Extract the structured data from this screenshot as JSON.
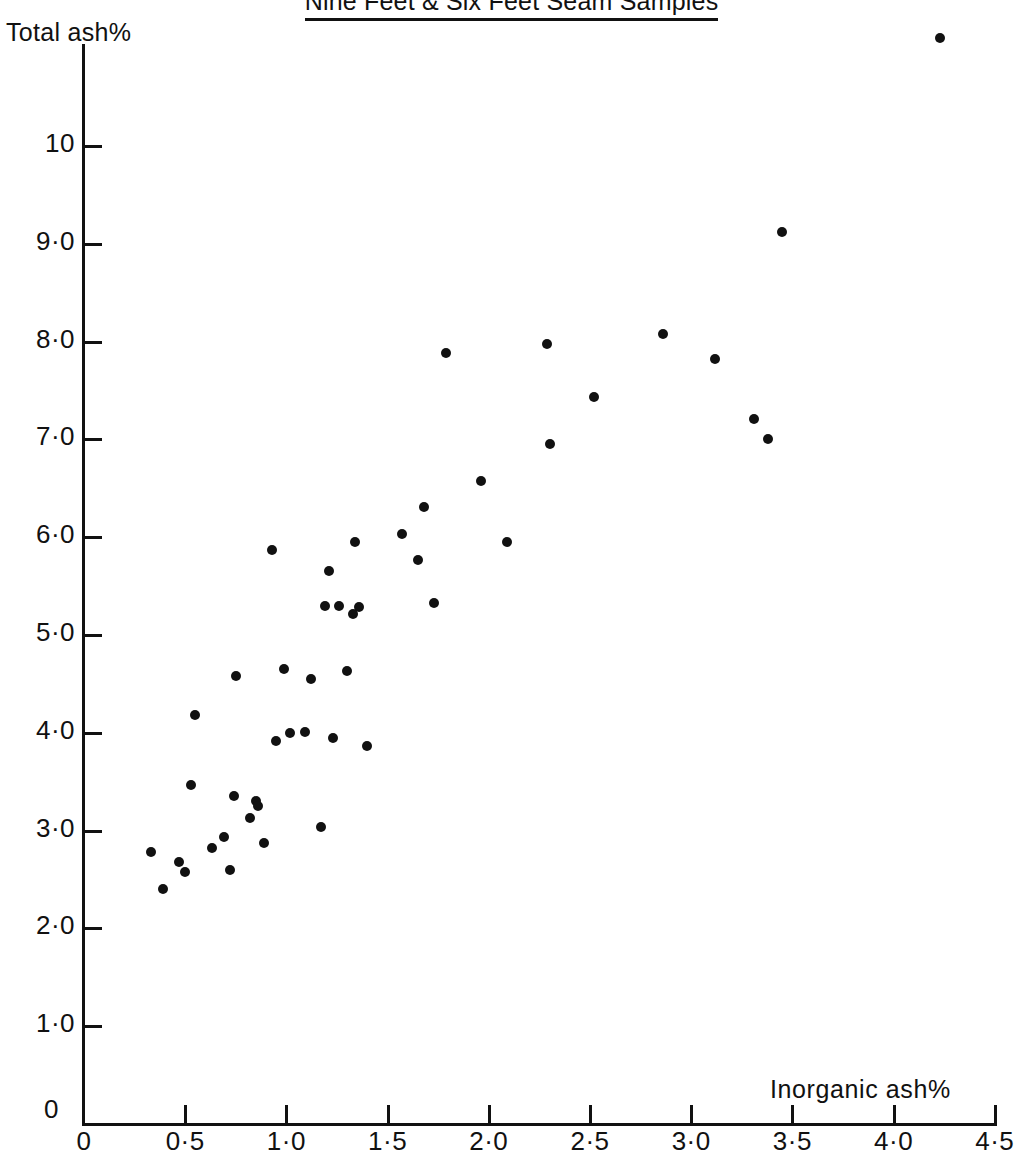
{
  "chart_data": {
    "type": "scatter",
    "title": "Nine Feet & Six Feet Seam Samples",
    "xlabel": "Inorganic ash%",
    "ylabel": "Total ash%",
    "xlim": [
      0,
      4.5
    ],
    "ylim": [
      0,
      11.2
    ],
    "grid": false,
    "legend": null,
    "x_ticks": [
      {
        "value": 0,
        "label": "0"
      },
      {
        "value": 0.5,
        "label": "0·5"
      },
      {
        "value": 1.0,
        "label": "1·0"
      },
      {
        "value": 1.5,
        "label": "1·5"
      },
      {
        "value": 2.0,
        "label": "2·0"
      },
      {
        "value": 2.5,
        "label": "2·5"
      },
      {
        "value": 3.0,
        "label": "3·0"
      },
      {
        "value": 3.5,
        "label": "3·5"
      },
      {
        "value": 4.0,
        "label": "4·0"
      },
      {
        "value": 4.5,
        "label": "4·5"
      }
    ],
    "y_ticks": [
      {
        "value": 1.0,
        "label": "1·0"
      },
      {
        "value": 2.0,
        "label": "2·0"
      },
      {
        "value": 3.0,
        "label": "3·0"
      },
      {
        "value": 4.0,
        "label": "4·0"
      },
      {
        "value": 5.0,
        "label": "5·0"
      },
      {
        "value": 6.0,
        "label": "6·0"
      },
      {
        "value": 7.0,
        "label": "7·0"
      },
      {
        "value": 8.0,
        "label": "8·0"
      },
      {
        "value": 9.0,
        "label": "9·0"
      },
      {
        "value": 10.0,
        "label": "10"
      }
    ],
    "origin_label": "0",
    "marker": {
      "shape": "circle",
      "color": "#111111",
      "size_px": 10
    },
    "points": [
      {
        "x": 0.33,
        "y": 2.78
      },
      {
        "x": 0.39,
        "y": 2.4
      },
      {
        "x": 0.47,
        "y": 2.68
      },
      {
        "x": 0.5,
        "y": 2.58
      },
      {
        "x": 0.53,
        "y": 3.47
      },
      {
        "x": 0.55,
        "y": 4.18
      },
      {
        "x": 0.63,
        "y": 2.82
      },
      {
        "x": 0.69,
        "y": 2.93
      },
      {
        "x": 0.72,
        "y": 2.6
      },
      {
        "x": 0.74,
        "y": 3.35
      },
      {
        "x": 0.75,
        "y": 4.58
      },
      {
        "x": 0.82,
        "y": 3.13
      },
      {
        "x": 0.85,
        "y": 3.3
      },
      {
        "x": 0.86,
        "y": 3.25
      },
      {
        "x": 0.89,
        "y": 2.87
      },
      {
        "x": 0.93,
        "y": 5.87
      },
      {
        "x": 0.95,
        "y": 3.92
      },
      {
        "x": 0.99,
        "y": 4.65
      },
      {
        "x": 1.02,
        "y": 4.0
      },
      {
        "x": 1.09,
        "y": 4.01
      },
      {
        "x": 1.12,
        "y": 4.55
      },
      {
        "x": 1.17,
        "y": 3.04
      },
      {
        "x": 1.19,
        "y": 5.3
      },
      {
        "x": 1.21,
        "y": 5.65
      },
      {
        "x": 1.23,
        "y": 3.95
      },
      {
        "x": 1.26,
        "y": 5.3
      },
      {
        "x": 1.3,
        "y": 4.63
      },
      {
        "x": 1.33,
        "y": 5.21
      },
      {
        "x": 1.34,
        "y": 5.95
      },
      {
        "x": 1.36,
        "y": 5.29
      },
      {
        "x": 1.4,
        "y": 3.87
      },
      {
        "x": 1.57,
        "y": 6.03
      },
      {
        "x": 1.65,
        "y": 5.77
      },
      {
        "x": 1.68,
        "y": 6.31
      },
      {
        "x": 1.73,
        "y": 5.33
      },
      {
        "x": 1.79,
        "y": 7.88
      },
      {
        "x": 1.96,
        "y": 6.57
      },
      {
        "x": 2.09,
        "y": 5.95
      },
      {
        "x": 2.29,
        "y": 7.98
      },
      {
        "x": 2.3,
        "y": 6.95
      },
      {
        "x": 2.52,
        "y": 7.43
      },
      {
        "x": 2.86,
        "y": 8.08
      },
      {
        "x": 3.12,
        "y": 7.82
      },
      {
        "x": 3.31,
        "y": 7.21
      },
      {
        "x": 3.38,
        "y": 7.0
      },
      {
        "x": 3.45,
        "y": 9.12
      },
      {
        "x": 4.23,
        "y": 11.1
      }
    ]
  }
}
